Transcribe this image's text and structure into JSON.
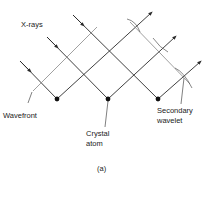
{
  "diagram": {
    "labels": {
      "xrays": "X-rays",
      "wavefront": "Wavefront",
      "crystal_atom_line1": "Crystal",
      "crystal_atom_line2": "atom",
      "secondary_line1": "Secondary",
      "secondary_line2": "wavelet",
      "caption": "(a)"
    },
    "atoms": [
      {
        "x": 57,
        "y": 99
      },
      {
        "x": 108,
        "y": 99
      },
      {
        "x": 158,
        "y": 99
      }
    ],
    "colors": {
      "line": "#2a2a2a",
      "wavefront": "#888888",
      "text": "#222222"
    }
  }
}
